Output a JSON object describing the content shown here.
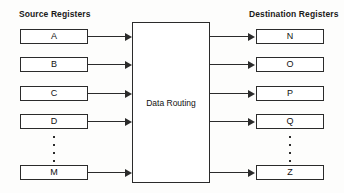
{
  "diagram": {
    "type": "block-diagram",
    "colors": {
      "background": "#fdfdfc",
      "box_fill": "#ffffff",
      "stroke": "#2b2b2b",
      "text": "#111111"
    },
    "source_column": {
      "heading": "Source Registers",
      "registers": [
        {
          "label": "A"
        },
        {
          "label": "B"
        },
        {
          "label": "C"
        },
        {
          "label": "D"
        },
        {
          "label": "M"
        }
      ],
      "ellipsis_dots": 4,
      "ellipsis_after_index": 3
    },
    "center": {
      "label": "Data Routing"
    },
    "destination_column": {
      "heading": "Destination Registers",
      "registers": [
        {
          "label": "N"
        },
        {
          "label": "O"
        },
        {
          "label": "P"
        },
        {
          "label": "Q"
        },
        {
          "label": "Z"
        }
      ],
      "ellipsis_dots": 4,
      "ellipsis_after_index": 3
    },
    "connections": {
      "source_to_center": 5,
      "center_to_destination": 5,
      "arrow_style": "solid-line-filled-triangle-head"
    },
    "row_tops": [
      29,
      57,
      86,
      114,
      165
    ]
  }
}
